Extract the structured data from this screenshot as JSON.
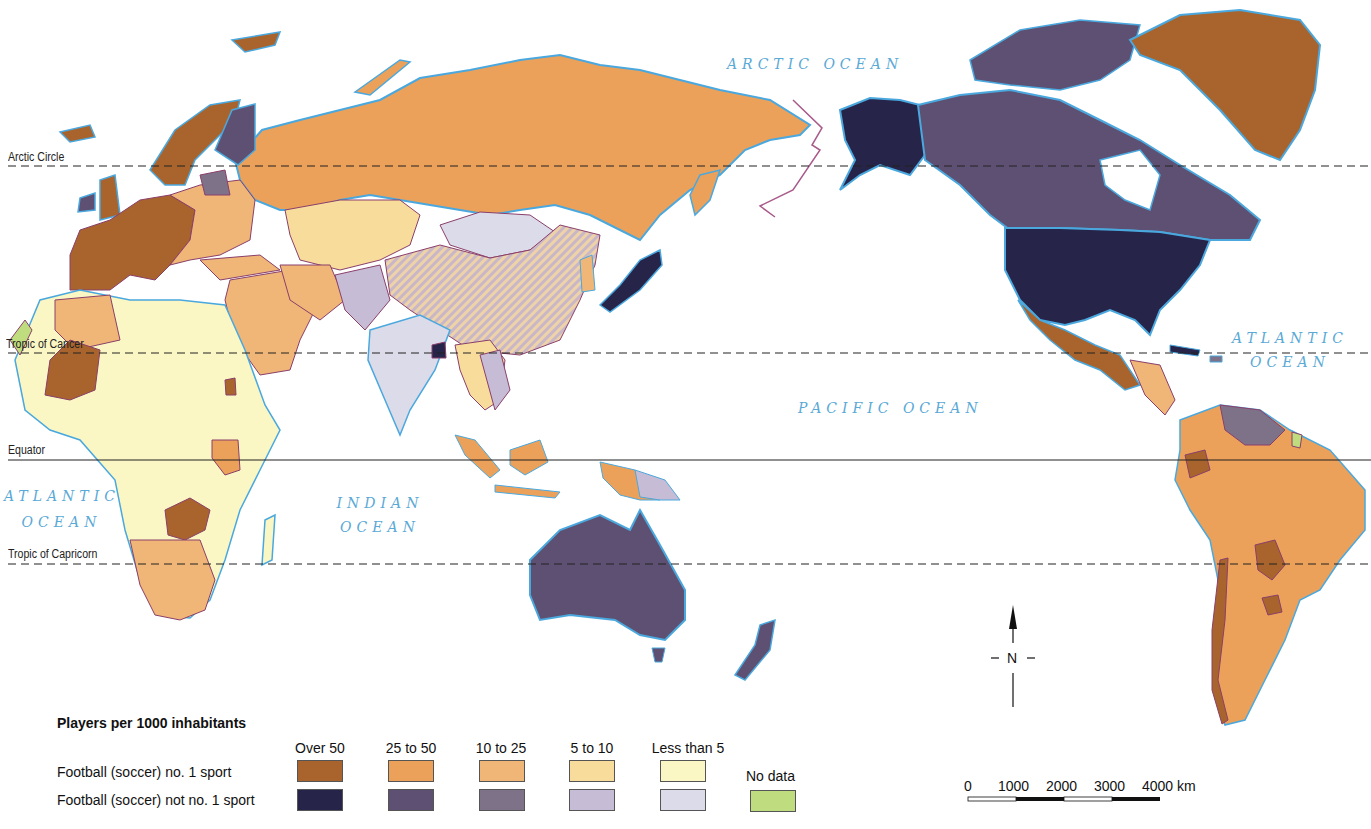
{
  "title": "Players per 1000 inhabitants",
  "oceans": {
    "arctic": "ARCTIC OCEAN",
    "atlantic_east": [
      "ATLANTIC",
      "OCEAN"
    ],
    "atlantic_west": [
      "ATLANTIC",
      "OCEAN"
    ],
    "indian": [
      "INDIAN",
      "OCEAN"
    ],
    "pacific": "PACIFIC OCEAN"
  },
  "latitude_lines": {
    "arctic_circle": "Arctic Circle",
    "tropic_of_cancer": "Tropic of Cancer",
    "equator": "Equator",
    "tropic_of_capricorn": "Tropic of Capricorn"
  },
  "legend": {
    "title": "Players per 1000 inhabitants",
    "categories": [
      "Over 50",
      "25 to 50",
      "10 to 25",
      "5 to 10",
      "Less than 5"
    ],
    "rows": [
      {
        "label": "Football (soccer) no. 1 sport",
        "colors": [
          "#a8642c",
          "#eca15a",
          "#efb677",
          "#f8dc9c",
          "#fbf7c4"
        ]
      },
      {
        "label": "Football (soccer) not no. 1 sport",
        "colors": [
          "#27244a",
          "#5e5072",
          "#7e7289",
          "#c7bcd6",
          "#dcdbe9"
        ]
      }
    ],
    "no_data": {
      "label": "No data",
      "color": "#bfdd7f"
    }
  },
  "compass": {
    "label": "N"
  },
  "scale_bar": {
    "labels": [
      "0",
      "1000",
      "2000",
      "3000",
      "4000 km"
    ]
  },
  "colors": {
    "coast": "#4aa8de",
    "border": "#8a3f6a",
    "ocean_text": "#5aa9d6"
  }
}
